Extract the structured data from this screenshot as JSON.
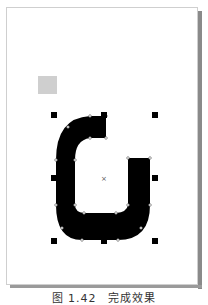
{
  "canvas": {
    "background": "#ffffff",
    "page_border": "#cfcfcf",
    "shadow_color": "#8a8a8a"
  },
  "swatch": {
    "color": "#cfcfcf"
  },
  "shape": {
    "description": "U-shaped curved path with node points, selected",
    "fill": "#000000",
    "center_marker": "×"
  },
  "selection_handles": {
    "count": 8,
    "color": "#000000"
  },
  "caption": {
    "text": "图 1.42　完成效果"
  }
}
